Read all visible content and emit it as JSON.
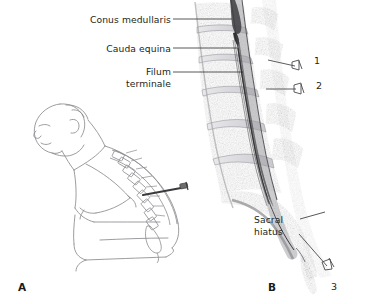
{
  "figure": {
    "type": "medical-illustration",
    "background": "#ffffff",
    "ink_color": "#231f20",
    "line_art_color": "#8c8c90",
    "mri_tone": "#9a9a9e"
  },
  "panels": [
    {
      "id": "A",
      "label": "A",
      "x": 18,
      "y": 283,
      "description": "Lateral line drawing of seated patient flexed forward with needle in lumbar spine"
    },
    {
      "id": "B",
      "label": "B",
      "x": 268,
      "y": 283,
      "description": "Sagittal section of lumbosacral spine showing cord, cauda equina and sacral hiatus"
    }
  ],
  "labels": [
    {
      "name": "conus-medullaris",
      "text": "Conus medullaris",
      "x": 86,
      "y": 14,
      "align": "right",
      "leader": {
        "x1": 173,
        "y1": 19,
        "x2": 232,
        "y2": 19
      }
    },
    {
      "name": "cauda-equina",
      "text": "Cauda equina",
      "x": 95,
      "y": 43,
      "align": "right",
      "leader": {
        "x1": 173,
        "y1": 48,
        "x2": 237,
        "y2": 48
      }
    },
    {
      "name": "filum-terminale",
      "line1": "Filum",
      "line2": "terminale",
      "x": 104,
      "y": 66,
      "align": "right",
      "leader": {
        "x1": 173,
        "y1": 72,
        "x2": 243,
        "y2": 72
      }
    },
    {
      "name": "sacral-hiatus",
      "line1": "Sacral",
      "line2": "hiatus",
      "x": 254,
      "y": 214,
      "align": "left",
      "leader": {
        "x1": 300,
        "y1": 219,
        "x2": 325,
        "y2": 213
      }
    }
  ],
  "markers": [
    {
      "name": "marker-1",
      "number": "1",
      "x": 314,
      "y": 60,
      "needle": {
        "hub_x": 296,
        "hub_y": 66,
        "tip_x": 268,
        "tip_y": 60
      },
      "meaning": "needle placement level 1"
    },
    {
      "name": "marker-2",
      "number": "2",
      "x": 316,
      "y": 84,
      "needle": {
        "hub_x": 298,
        "hub_y": 89,
        "tip_x": 266,
        "tip_y": 89
      },
      "meaning": "needle placement level 2"
    },
    {
      "name": "marker-3",
      "number": "3",
      "x": 331,
      "y": 286,
      "needle": {
        "hub_x": 326,
        "hub_y": 264,
        "tip_x": 300,
        "tip_y": 236
      },
      "meaning": "caudal needle at sacral hiatus"
    }
  ],
  "panel_a_needle": {
    "name": "lumbar-needle",
    "tip_x": 143,
    "tip_y": 195,
    "hub_x": 186,
    "hub_y": 187
  }
}
